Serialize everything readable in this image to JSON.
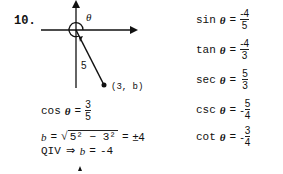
{
  "problem": {
    "number": "10.",
    "diagram": {
      "angle_label": "θ",
      "hypotenuse_label": "5",
      "point_label": "(3, b)"
    },
    "work": {
      "cos": {
        "fn": "cos",
        "var": "θ",
        "eq": "=",
        "num": "3",
        "den": "5"
      },
      "b_line": {
        "lhs": "b",
        "eq1": "=",
        "radicand": "5² − 3²",
        "eq2": "=",
        "result": "±4"
      },
      "qiv_line": {
        "text": "QIV",
        "implies": "⇒",
        "var": "b",
        "eq": "=",
        "value": "-4"
      }
    },
    "answers": [
      {
        "fn": "sin",
        "var": "θ",
        "eq": "=",
        "sign": "",
        "num": "-4",
        "den": "5"
      },
      {
        "fn": "tan",
        "var": "θ",
        "eq": "=",
        "sign": "",
        "num": "-4",
        "den": "3"
      },
      {
        "fn": "sec",
        "var": "θ",
        "eq": "=",
        "sign": "",
        "num": "5",
        "den": "3"
      },
      {
        "fn": "csc",
        "var": "θ",
        "eq": "=",
        "sign": "-",
        "num": "5",
        "den": "4"
      },
      {
        "fn": "cot",
        "var": "θ",
        "eq": "=",
        "sign": "-",
        "num": "3",
        "den": "4"
      }
    ]
  }
}
